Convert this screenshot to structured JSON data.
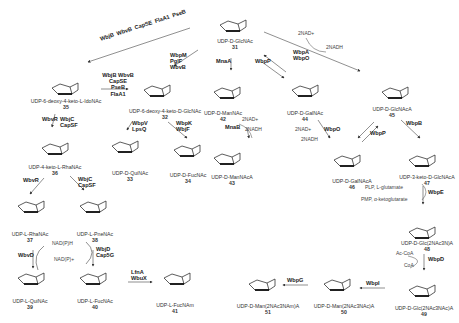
{
  "diagram": {
    "type": "biosynthetic-pathway",
    "compounds": [
      {
        "id": "31",
        "name": "UDP-D-GlcNAc",
        "x": 200,
        "y": 3
      },
      {
        "id": "32",
        "name": "UDP-6-deoxy-4-keto-D-GlcNAc",
        "x": 110,
        "y": 68
      },
      {
        "id": "35",
        "name": "UDP-6-deoxy-4-keto-L-IdoNAc",
        "x": 20,
        "y": 66
      },
      {
        "id": "36",
        "name": "UDP-4-keto-L-RhaNAc",
        "x": 22,
        "y": 130
      },
      {
        "id": "33",
        "name": "UDP-D-QuiNAc",
        "x": 98,
        "y": 130
      },
      {
        "id": "34",
        "name": "UDP-D-FucNAc",
        "x": 160,
        "y": 130
      },
      {
        "id": "37",
        "name": "UDP-L-RhaNAc",
        "x": 4,
        "y": 190
      },
      {
        "id": "38",
        "name": "UDP-L-PneNAc",
        "x": 70,
        "y": 190
      },
      {
        "id": "39",
        "name": "UDP-L-QuiNAc",
        "x": 4,
        "y": 262
      },
      {
        "id": "40",
        "name": "UDP-L-FucNAc",
        "x": 70,
        "y": 262
      },
      {
        "id": "41",
        "name": "UDP-L-FucNAm",
        "x": 150,
        "y": 262
      },
      {
        "id": "42",
        "name": "UDP-D-ManNAc",
        "x": 196,
        "y": 72
      },
      {
        "id": "43",
        "name": "UDP-D-ManNAcA",
        "x": 196,
        "y": 135
      },
      {
        "id": "44",
        "name": "UDP-D-GalNAc",
        "x": 280,
        "y": 72
      },
      {
        "id": "45",
        "name": "UDP-D-GlcNAcA",
        "x": 365,
        "y": 72
      },
      {
        "id": "46",
        "name": "UDP-D-GalNAcA",
        "x": 318,
        "y": 152
      },
      {
        "id": "47",
        "name": "UDP-3-keto-D-GlcNAcA",
        "x": 393,
        "y": 150
      },
      {
        "id": "48",
        "name": "UDP-D-Glc(2NAc3N)A",
        "x": 393,
        "y": 220
      },
      {
        "id": "49",
        "name": "UDP-D-Glc(2NAc3NAc)A",
        "x": 388,
        "y": 278
      },
      {
        "id": "50",
        "name": "UDP-D-Man(2NAc3NAc)A",
        "x": 308,
        "y": 268
      },
      {
        "id": "51",
        "name": "UDP-D-Man(2NAc3NAm)A",
        "x": 233,
        "y": 268
      }
    ],
    "enzymes": {
      "e31_35": "WbjB\nWbvB\nCapSE\nFlaA1\nPseB",
      "e35_32": "WbjB WbvB\nCapSE PseB\nFlaA1",
      "e31_32": "WbpM\nPglF\nWbvB",
      "e35_36": "WbvR",
      "e35_36b": "WbjC\nCapSF",
      "e32_33": "WbpV\nLpsQ",
      "e32_34": "WbpK\nWbjF",
      "e36_37": "WbvR",
      "e36_38": "WbjC\nCapSF",
      "e37_39": "WbvD",
      "e38_40": "WbjD\nCap5G",
      "e40_41": "LfnA\nWbuX",
      "e31_42": "MnaA",
      "e31_44": "WbpP",
      "e31_45": "WbpA\nWbpO",
      "e42_43": "MnaB",
      "e44_46": "WbpO",
      "e45_46": "WbpP",
      "e45_47": "WbpB",
      "e47_48": "WbpE",
      "e48_49": "WbpD",
      "e49_50": "WbpI",
      "e50_51": "WbpG"
    },
    "cofactors": {
      "c31_45_in": "2NAD+",
      "c31_45_out": "2NADH",
      "c42_43_in": "2NAD+",
      "c42_43_out": "2NADH",
      "c44_46_in": "2NAD+",
      "c44_46_out": "2NADH",
      "c47_48_in": "PLP, L-glutamate",
      "c47_48_out": "PMP, α-ketoglutarate",
      "c48_49_in": "Ac-CoA",
      "c48_49_out": "CoA",
      "c_red_top": "NAD(P)H",
      "c_red_bot": "NAD(P)+"
    }
  }
}
